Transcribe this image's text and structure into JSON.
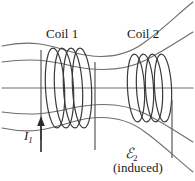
{
  "figure": {
    "background_color": "#ffffff",
    "line_color": "#6e6e6e",
    "coil_color": "#3a3a3a",
    "text_color": "#1a1a1a"
  },
  "labels": {
    "coil1": "Coil 1",
    "coil2": "Coil 2",
    "current_symbol": "I",
    "current_subscript": "1",
    "emf_symbol": "ℰ",
    "emf_subscript": "2",
    "induced": "(induced)"
  },
  "icons": {
    "current_arrow": "up-arrow-icon",
    "field_lines": "magnetic-field-lines-icon",
    "coil_1": "solenoid-coil-icon",
    "coil_2": "solenoid-coil-icon"
  },
  "diagram_data": {
    "type": "physics-schematic",
    "field_line_count": 5,
    "coil_1_turns": 4,
    "coil_2_turns": 4,
    "coil_1_center_x": 72,
    "coil_2_center_x": 152,
    "axis_y": 88,
    "current_direction": "up"
  }
}
